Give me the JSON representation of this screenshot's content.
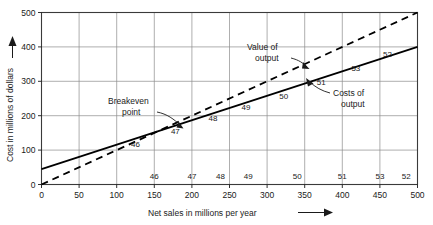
{
  "chart_data": {
    "type": "line",
    "title": "",
    "xlabel": "Net sales in millions per year",
    "ylabel": "Cost in millions of dollars",
    "xlim": [
      0,
      500
    ],
    "ylim": [
      0,
      500
    ],
    "xticks": [
      "0",
      "50",
      "100",
      "150",
      "200",
      "250",
      "300",
      "350",
      "400",
      "450",
      "500"
    ],
    "xtick_values": [
      0,
      50,
      100,
      150,
      200,
      250,
      300,
      350,
      400,
      450,
      500
    ],
    "yticks": [
      "0",
      "100",
      "200",
      "300",
      "400",
      "500"
    ],
    "ytick_values": [
      0,
      100,
      200,
      300,
      400,
      500
    ],
    "grid": true,
    "grid_color": "#8c8c8c",
    "series": [
      {
        "name": "Costs of output",
        "style": "solid",
        "color": "#000000",
        "x": [
          0,
          500
        ],
        "y": [
          45,
          400
        ]
      },
      {
        "name": "Value of output",
        "style": "dashed",
        "color": "#000000",
        "x": [
          0,
          500
        ],
        "y": [
          0,
          500
        ]
      }
    ],
    "annotations": [
      {
        "text_line1": "Breakeven",
        "text_line2": "point",
        "target_x": 190,
        "target_y": 180
      },
      {
        "text_line1": "Value of",
        "text_line2": "output",
        "target_x": 300,
        "target_y": 300
      },
      {
        "text_line1": "Costs of",
        "text_line2": "output",
        "target_x": 360,
        "target_y": 300
      }
    ],
    "year_labels_on_line": [
      {
        "label": "46",
        "x": 125,
        "y": 110
      },
      {
        "label": "47",
        "x": 178,
        "y": 148
      },
      {
        "label": "48",
        "x": 228,
        "y": 184
      },
      {
        "label": "49",
        "x": 272,
        "y": 218
      },
      {
        "label": "50",
        "x": 322,
        "y": 250
      },
      {
        "label": "51",
        "x": 372,
        "y": 290
      },
      {
        "label": "53",
        "x": 418,
        "y": 330
      },
      {
        "label": "52",
        "x": 460,
        "y": 372
      }
    ],
    "year_labels_on_axis": [
      {
        "label": "46",
        "x": 150
      },
      {
        "label": "47",
        "x": 200
      },
      {
        "label": "48",
        "x": 238
      },
      {
        "label": "49",
        "x": 275
      },
      {
        "label": "50",
        "x": 340
      },
      {
        "label": "51",
        "x": 400
      },
      {
        "label": "53",
        "x": 450
      },
      {
        "label": "52",
        "x": 485
      }
    ]
  },
  "axes": {
    "x_title": "Net sales in millions per year",
    "y_title": "Cost in millions of dollars"
  },
  "labels": {
    "breakeven_l1": "Breakeven",
    "breakeven_l2": "point",
    "value_l1": "Value of",
    "value_l2": "output",
    "costs_l1": "Costs of",
    "costs_l2": "output"
  },
  "ticks": {
    "x": [
      "0",
      "50",
      "100",
      "150",
      "200",
      "250",
      "300",
      "350",
      "400",
      "450",
      "500"
    ],
    "y": [
      "0",
      "100",
      "200",
      "300",
      "400",
      "500"
    ]
  },
  "inline_years": [
    "46",
    "47",
    "48",
    "49",
    "50",
    "51",
    "53",
    "52"
  ],
  "axis_years": [
    "46",
    "47",
    "48",
    "49",
    "50",
    "51",
    "53",
    "52"
  ]
}
